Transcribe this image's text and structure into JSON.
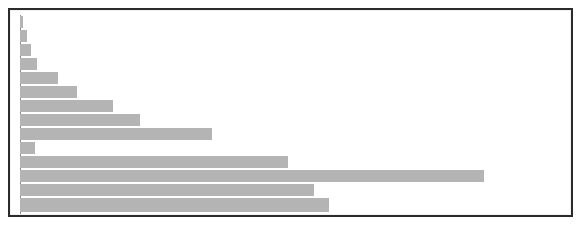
{
  "figure": {
    "background_color": "#ffffff",
    "frame_color": "#2b2b2b",
    "plot_background": "#ffffff"
  },
  "chart_data": {
    "type": "bar",
    "orientation": "horizontal",
    "title": "",
    "subtitle": "",
    "xlabel": "",
    "ylabel": "",
    "grid": false,
    "legend": false,
    "axis_visible": false,
    "tick_labels_visible": false,
    "bar_color": "#b4b4b4",
    "bar_edge_color": "#b4b4b4",
    "xlim": [
      0,
      548
    ],
    "categories": [
      "bar-1",
      "bar-2",
      "bar-3",
      "bar-4",
      "bar-5",
      "bar-6",
      "bar-7",
      "bar-8",
      "bar-9",
      "bar-10",
      "bar-11",
      "bar-12",
      "bar-13",
      "bar-14"
    ],
    "values": [
      3,
      7,
      11,
      17,
      38,
      57,
      93,
      120,
      192,
      15,
      268,
      464,
      294,
      309
    ],
    "bars": [
      {
        "index": 1,
        "value": 3,
        "top": 1,
        "height": 12
      },
      {
        "index": 2,
        "value": 7,
        "top": 15,
        "height": 12
      },
      {
        "index": 3,
        "value": 11,
        "top": 29,
        "height": 12
      },
      {
        "index": 4,
        "value": 17,
        "top": 43,
        "height": 12
      },
      {
        "index": 5,
        "value": 38,
        "top": 57,
        "height": 12
      },
      {
        "index": 6,
        "value": 57,
        "top": 71,
        "height": 12
      },
      {
        "index": 7,
        "value": 93,
        "top": 85,
        "height": 12
      },
      {
        "index": 8,
        "value": 120,
        "top": 99,
        "height": 12
      },
      {
        "index": 9,
        "value": 192,
        "top": 113,
        "height": 12
      },
      {
        "index": 10,
        "value": 15,
        "top": 127,
        "height": 12
      },
      {
        "index": 11,
        "value": 268,
        "top": 141,
        "height": 12
      },
      {
        "index": 12,
        "value": 464,
        "top": 155,
        "height": 12
      },
      {
        "index": 13,
        "value": 294,
        "top": 169,
        "height": 12
      },
      {
        "index": 14,
        "value": 309,
        "top": 183,
        "height": 14
      }
    ]
  }
}
